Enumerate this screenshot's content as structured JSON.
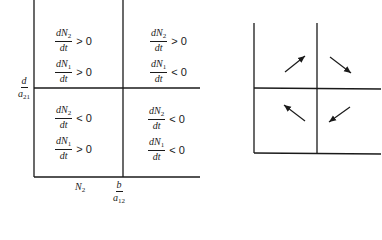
{
  "left_diagram": {
    "quadrants": {
      "top_left": [
        {
          "num_var": "dN",
          "num_sub": "2",
          "den": "dt",
          "relation": "> 0"
        },
        {
          "num_var": "dN",
          "num_sub": "1",
          "den": "dt",
          "relation": "> 0"
        }
      ],
      "top_right": [
        {
          "num_var": "dN",
          "num_sub": "2",
          "den": "dt",
          "relation": "> 0"
        },
        {
          "num_var": "dN",
          "num_sub": "1",
          "den": "dt",
          "relation": "< 0"
        }
      ],
      "bottom_left": [
        {
          "num_var": "dN",
          "num_sub": "2",
          "den": "dt",
          "relation": "< 0"
        },
        {
          "num_var": "dN",
          "num_sub": "1",
          "den": "dt",
          "relation": "> 0"
        }
      ],
      "bottom_right": [
        {
          "num_var": "dN",
          "num_sub": "2",
          "den": "dt",
          "relation": "< 0"
        },
        {
          "num_var": "dN",
          "num_sub": "1",
          "den": "dt",
          "relation": "< 0"
        }
      ]
    },
    "y_axis_label": {
      "num": "d",
      "den_var": "a",
      "den_sub": "21"
    },
    "x_axis_label": {
      "var": "N",
      "sub": "2"
    },
    "x_threshold_label": {
      "num": "b",
      "den_var": "a",
      "den_sub": "12"
    }
  },
  "right_diagram": {
    "arrows": [
      {
        "quadrant": "top_left",
        "direction": "up-right"
      },
      {
        "quadrant": "top_right",
        "direction": "down-right"
      },
      {
        "quadrant": "bottom_left",
        "direction": "up-left"
      },
      {
        "quadrant": "bottom_right",
        "direction": "down-left"
      }
    ]
  },
  "colors": {
    "ink": "#1a1a1a",
    "background": "#ffffff"
  }
}
